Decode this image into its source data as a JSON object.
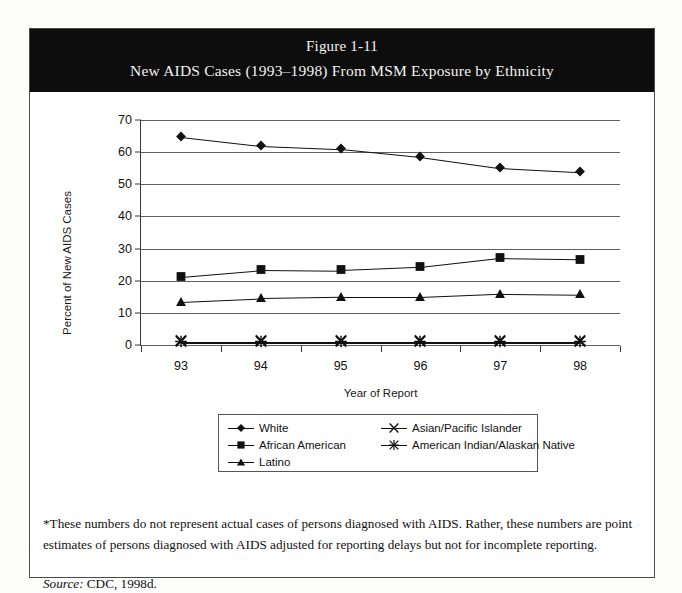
{
  "figure": {
    "title_line1": "Figure 1-11",
    "title_line2": "New AIDS Cases (1993–1998) From MSM Exposure by Ethnicity",
    "footnote": "*These numbers do not represent actual cases of persons diagnosed with AIDS.  Rather, these numbers are point estimates of persons diagnosed with AIDS adjusted for reporting delays but not for incomplete reporting.",
    "source_label": "Source:",
    "source_value": "CDC, 1998d."
  },
  "colors": {
    "banner_background": "#0d0d0d",
    "banner_text": "#f2f2f2",
    "frame_border": "#4a4a4a",
    "gridline": "#606060",
    "series": "#111111",
    "page_background": "#ffffff"
  },
  "chart_data": {
    "type": "line",
    "title": "New AIDS Cases (1993–1998) From MSM Exposure by Ethnicity",
    "xlabel": "Year of Report",
    "ylabel": "Percent of New AIDS Cases",
    "categories": [
      "93",
      "94",
      "95",
      "96",
      "97",
      "98"
    ],
    "ylim": [
      0,
      70
    ],
    "yticks": [
      0,
      10,
      20,
      30,
      40,
      50,
      60,
      70
    ],
    "grid": true,
    "legend_position": "bottom",
    "series": [
      {
        "name": "White",
        "marker": "diamond",
        "values": [
          64.8,
          62.0,
          61.0,
          58.5,
          55.0,
          53.7
        ]
      },
      {
        "name": "African American",
        "marker": "square",
        "values": [
          21.3,
          23.4,
          23.2,
          24.2,
          27.0,
          26.6
        ]
      },
      {
        "name": "Latino",
        "marker": "triangle",
        "values": [
          13.5,
          14.6,
          15.0,
          15.0,
          16.0,
          15.8
        ]
      },
      {
        "name": "Asian/Pacific Islander",
        "marker": "x",
        "values": [
          1.0,
          1.0,
          1.0,
          1.0,
          1.0,
          1.0
        ]
      },
      {
        "name": "American Indian/Alaskan Native",
        "marker": "star",
        "values": [
          0.6,
          0.6,
          0.6,
          0.6,
          0.6,
          0.6
        ]
      }
    ]
  }
}
